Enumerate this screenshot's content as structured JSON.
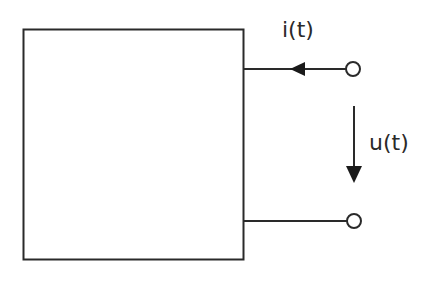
{
  "diagram": {
    "type": "two-port terminal block (one-port network)",
    "block": {
      "label": ""
    },
    "labels": {
      "current": "i(t)",
      "voltage": "u(t)"
    },
    "current_arrow": {
      "direction": "left",
      "description": "current flows into the block from the upper terminal"
    },
    "voltage_arrow": {
      "direction": "down",
      "description": "voltage reference from upper terminal to lower terminal"
    },
    "terminals": [
      {
        "name": "upper-terminal"
      },
      {
        "name": "lower-terminal"
      }
    ],
    "colors": {
      "stroke": "#2a2a2a",
      "background": "#ffffff"
    }
  }
}
